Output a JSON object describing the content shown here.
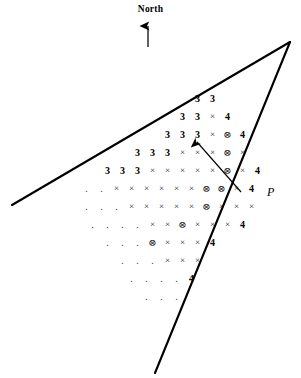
{
  "figure": {
    "title_label": "North",
    "point_label": "P",
    "width": 301,
    "height": 378,
    "background_color": "#ffffff",
    "ink_color": "#000000"
  },
  "north_arrow": {
    "name": "north-arrow",
    "label": "North",
    "direction": "up",
    "x": 148,
    "y_top": 22,
    "y_bottom": 47
  },
  "pointer_arrow": {
    "name": "pointer-arrow",
    "description": "arrow pointing up-left toward the circled-x symbol",
    "tail_x": 241,
    "tail_y": 192,
    "head_x": 193,
    "head_y": 138
  },
  "boundary_lines": [
    {
      "name": "upper-boundary-line",
      "x1": 12,
      "y1": 205,
      "x2": 290,
      "y2": 42
    },
    {
      "name": "lower-boundary-line",
      "x1": 290,
      "y1": 42,
      "x2": 155,
      "y2": 373
    }
  ],
  "symbol_legend": {
    "num3": "3",
    "num4": "4",
    "cross": "×",
    "circled_cross": "⊗",
    "dot": "."
  },
  "grid": {
    "name": "symbol-grid",
    "cell_width": 15,
    "row_height": 18,
    "first_row_top": 92,
    "rows": [
      {
        "left": 190,
        "cells": [
          "3",
          "3"
        ]
      },
      {
        "left": 175,
        "cells": [
          "3",
          "3",
          "×",
          "4"
        ]
      },
      {
        "left": 160,
        "cells": [
          "3",
          "3",
          "3",
          "×",
          "⊗",
          "4"
        ]
      },
      {
        "left": 130,
        "cells": [
          "3",
          "3",
          "3",
          "×",
          "×",
          "×",
          "⊗",
          "×"
        ]
      },
      {
        "left": 100,
        "cells": [
          "3",
          "3",
          "3",
          "×",
          "×",
          "×",
          "×",
          "×",
          "⊗",
          "×",
          "4"
        ]
      },
      {
        "left": 79,
        "cells": [
          ".",
          ".",
          "×",
          "×",
          "×",
          "×",
          "×",
          "×",
          "⊗",
          "⊗",
          "×",
          "4"
        ]
      },
      {
        "left": 79,
        "cells": [
          ".",
          ".",
          ".",
          "×",
          "×",
          "×",
          "×",
          "×",
          "⊗",
          "×",
          "×",
          "×"
        ]
      },
      {
        "left": 85,
        "cells": [
          ".",
          ".",
          ".",
          ".",
          "×",
          "×",
          "⊗",
          "×",
          "×",
          "×",
          "4"
        ]
      },
      {
        "left": 100,
        "cells": [
          ".",
          ".",
          ".",
          "⊗",
          "×",
          "×",
          "×",
          "4"
        ]
      },
      {
        "left": 115,
        "cells": [
          ".",
          ".",
          ".",
          "×",
          "×",
          "×"
        ]
      },
      {
        "left": 124,
        "cells": [
          ".",
          ".",
          ".",
          ".",
          "4"
        ]
      },
      {
        "left": 139,
        "cells": [
          ".",
          ".",
          "."
        ]
      }
    ]
  }
}
